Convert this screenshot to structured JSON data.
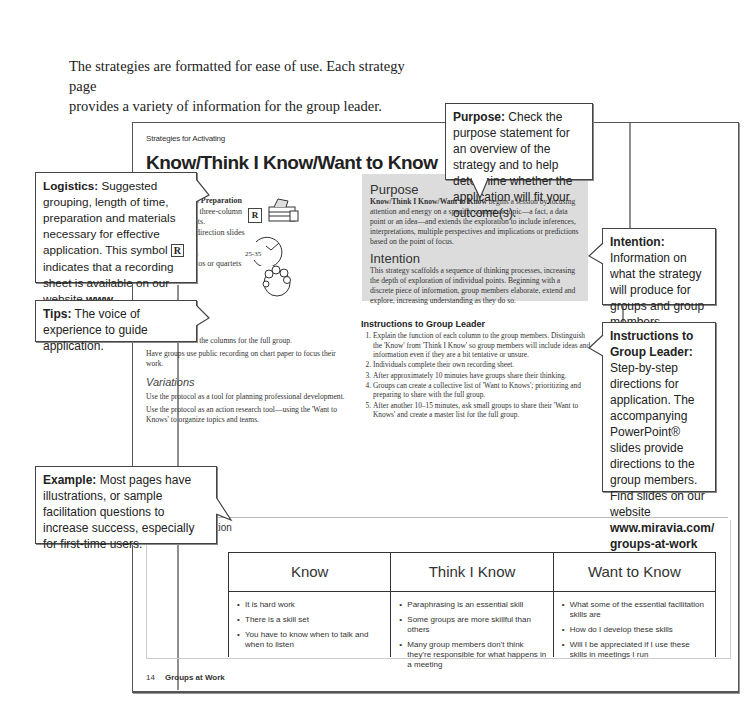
{
  "intro": {
    "line1": "The strategies are formatted for ease of use. Each strategy page",
    "line2": "provides a variety of information for the group leader."
  },
  "page": {
    "eyebrow": "Strategies for Activating",
    "title": "Know/Think I Know/Want to Know",
    "logistics": {
      "heading": "Logistics",
      "materials_label": "Materials and Preparation",
      "materials_1": "Reproduce the three-column",
      "materials_2": "recording sheets.",
      "materials_3": "Powerpoint® direction slides",
      "time_label": "Time",
      "time_value": "25–35 minutes",
      "grouping_label": "Grouping:",
      "grouping_value": "Trios or quartets",
      "recording_symbol": "R",
      "clock_label": "25-35"
    },
    "purpose": {
      "heading": "Purpose",
      "lead": "Know/Think I Know/Want to Know",
      "body": " begins a session by focusing attention and energy on a specific content or topic—a fact, a data point or an idea—and extends the exploration to include inferences, interpretations, multiple perspectives and implications or predictions based on the point of focus."
    },
    "intention": {
      "heading": "Intention",
      "body": "This strategy scaffolds a sequence of thinking processes, increasing the depth of exploration of individual points. Beginning with a discrete piece of information, group members elaborate, extend and explore, increasing understanding as they do so."
    },
    "tip": {
      "heading": "Tip",
      "p1": "Model the use of the columns for the full group.",
      "p2": "Have groups use public recording on chart paper to focus their work."
    },
    "variations": {
      "heading": "Variations",
      "p1": "Use the protocol as a tool for planning professional development.",
      "p2": "Use the protocol as an action research tool—using the 'Want to Knows' to organize topics and teams."
    },
    "instructions": {
      "heading": "Instructions to Group Leader",
      "steps": [
        "Explain the function of each column to the group members. Distinguish the 'Know' from 'Think I Know' so group members will include ideas and information even if they are a bit tentative or unsure.",
        "Individuals complete their own recording sheet.",
        "After approximately 10 minutes have groups share their thinking.",
        "Groups can create a collective list of 'Want to Knows'; prioritizing and preparing to share with the full group.",
        "After another 10–15 minutes, ask small groups to share their 'Want to Knows' and create a master list for the full group."
      ]
    },
    "example": {
      "label": "Example",
      "topic_label": "Topic:",
      "topic_value": "Facilitation",
      "columns": [
        {
          "header": "Know",
          "items": [
            "It is hard work",
            "There is a skill set",
            "You have to know when to talk and when to listen"
          ]
        },
        {
          "header": "Think I Know",
          "items": [
            "Paraphrasing is an essential skill",
            "Some groups are more skillful than others",
            "Many group members don't think they're responsible for what happens in a meeting"
          ]
        },
        {
          "header": "Want to Know",
          "items": [
            "What some of the essential facilitation skills are",
            "How do I develop these skills",
            "Will I be appreciated if I use these skills in meetings I run"
          ]
        }
      ]
    },
    "footer": {
      "page_number": "14",
      "book_title": "Groups at Work"
    }
  },
  "callouts": {
    "purpose": {
      "label": "Purpose:",
      "text": " Check the purpose statement for an overview of the strategy and to help determine whether the application will fit your outcome(s)."
    },
    "logistics": {
      "label": "Logistics:",
      "text_a": " Suggested grouping, length of time, preparation and materials necessary for effective application. This symbol ",
      "symbol": "R",
      "text_b": " indicates that a recording sheet is available on our website ",
      "url": "www. miravia.com/groups-at-work"
    },
    "tips": {
      "label": "Tips:",
      "text": " The voice of experience to guide application."
    },
    "intention": {
      "label": "Intention:",
      "text": " Information on what the strategy will produce for groups and group members."
    },
    "instructions": {
      "label": "Instructions to Group Leader:",
      "text": " Step-by-step directions for application. The accompanying PowerPoint® slides provide directions to the group members. Find slides on our website ",
      "url": "www.miravia.com/ groups-at-work"
    },
    "example": {
      "label": "Example:",
      "text": " Most pages have illustrations, or sample facilitation questions to increase success, especially for first-time users."
    }
  }
}
